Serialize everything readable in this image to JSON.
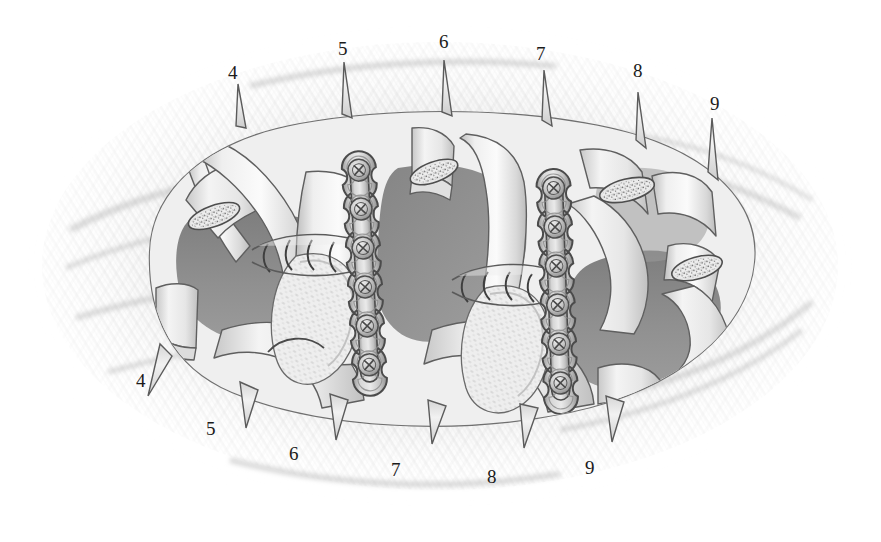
{
  "illustration": {
    "title": "Chest wall reconstruction with rib fixation plates",
    "description": "Grayscale surgical illustration of an open thoracotomy showing numbered ribs, two six-hole fixation plates with screws, cerclage wires, and cut rib ends with exposed cancellous bone.",
    "background_color": "#ffffff",
    "ink_color": "#4a4a4a",
    "cavity_color": "#8d8d8d",
    "soft_tissue_color": "#e8e8e8",
    "plate_color": "#c9c9c9",
    "screw_color": "#b4b4b4",
    "label_color": "#1b1b1b"
  },
  "labels": {
    "top": [
      {
        "text": "4",
        "x": 228,
        "y": 72
      },
      {
        "text": "5",
        "x": 338,
        "y": 48
      },
      {
        "text": "6",
        "x": 439,
        "y": 41
      },
      {
        "text": "7",
        "x": 536,
        "y": 53
      },
      {
        "text": "8",
        "x": 633,
        "y": 70
      },
      {
        "text": "9",
        "x": 710,
        "y": 103
      }
    ],
    "bottom": [
      {
        "text": "4",
        "x": 136,
        "y": 380
      },
      {
        "text": "5",
        "x": 206,
        "y": 428
      },
      {
        "text": "6",
        "x": 289,
        "y": 453
      },
      {
        "text": "7",
        "x": 391,
        "y": 469
      },
      {
        "text": "8",
        "x": 487,
        "y": 476
      },
      {
        "text": "9",
        "x": 585,
        "y": 467
      }
    ]
  },
  "hardware": {
    "plates": [
      {
        "name": "left-fixation-plate",
        "screw_count": 6,
        "x": 364,
        "y_top": 170,
        "y_bottom": 362,
        "angle": -3
      },
      {
        "name": "right-fixation-plate",
        "screw_count": 6,
        "x": 557,
        "y_top": 188,
        "y_bottom": 380,
        "angle": -2
      }
    ],
    "cerclage_wire_groups": [
      {
        "name": "left-cerclage-wires",
        "count": 4,
        "x": 300,
        "y": 248
      },
      {
        "name": "right-cerclage-wires",
        "count": 4,
        "x": 500,
        "y": 278
      }
    ]
  },
  "cut_rib_ends": [
    {
      "name": "cut-rib-end-upper-left",
      "cx": 214,
      "cy": 216,
      "rx": 26,
      "ry": 10,
      "rot": -20
    },
    {
      "name": "cut-rib-end-upper-mid",
      "cx": 437,
      "cy": 172,
      "rx": 24,
      "ry": 10,
      "rot": -18
    },
    {
      "name": "cut-rib-end-upper-right",
      "cx": 627,
      "cy": 190,
      "rx": 27,
      "ry": 11,
      "rot": -14
    },
    {
      "name": "cut-rib-end-lower-right",
      "cx": 697,
      "cy": 268,
      "rx": 26,
      "ry": 11,
      "rot": -16
    }
  ]
}
